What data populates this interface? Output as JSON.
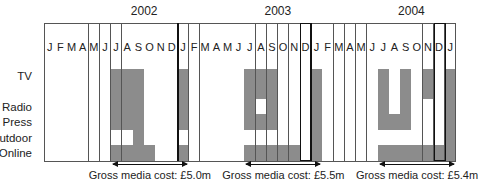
{
  "chart_data": {
    "type": "table",
    "years": [
      {
        "label": "2002",
        "center_col": 8.5
      },
      {
        "label": "2003",
        "center_col": 20.5
      },
      {
        "label": "2004",
        "center_col": 32.5
      }
    ],
    "months": [
      "J",
      "F",
      "M",
      "A",
      "M",
      "J",
      "J",
      "A",
      "S",
      "O",
      "N",
      "D",
      "J",
      "F",
      "M",
      "A",
      "M",
      "J",
      "J",
      "A",
      "S",
      "O",
      "N",
      "D",
      "J",
      "F",
      "M",
      "A",
      "M",
      "J",
      "J",
      "A",
      "S",
      "O",
      "N",
      "D",
      "J"
    ],
    "rows": [
      {
        "label": "TV",
        "shaded_cols": [
          6,
          7,
          8,
          12,
          18,
          19,
          20,
          24,
          30,
          32,
          34,
          36
        ]
      },
      {
        "label": "Radio",
        "shaded_cols": [
          6,
          7,
          8,
          12,
          18,
          20,
          24,
          30,
          32,
          36
        ]
      },
      {
        "label": "Press",
        "shaded_cols": [
          6,
          7,
          8,
          12,
          18,
          19,
          20,
          24,
          30,
          31,
          32,
          36
        ]
      },
      {
        "label": "Outdoor",
        "shaded_cols": [
          8,
          24,
          36
        ]
      },
      {
        "label": "Online",
        "shaded_cols": [
          6,
          7,
          8,
          9,
          12,
          18,
          19,
          20,
          21,
          22,
          24,
          30,
          31,
          32,
          33,
          34,
          35,
          36
        ]
      }
    ],
    "year_separators_after_col": [
      11,
      23
    ],
    "boxed_cols": [
      23,
      35
    ],
    "campaigns": [
      {
        "label": "Gross media cost: £5.0m",
        "from_col": 6,
        "to_col": 12,
        "value_m": 5.0
      },
      {
        "label": "Gross media cost: £5.5m",
        "from_col": 18,
        "to_col": 24,
        "value_m": 5.5
      },
      {
        "label": "Gross media cost: £5.4m",
        "from_col": 30,
        "to_col": 36,
        "value_m": 5.4
      }
    ],
    "colors": {
      "shaded": "#8c8c8c",
      "grid": "#555555",
      "background": "#ffffff"
    }
  }
}
